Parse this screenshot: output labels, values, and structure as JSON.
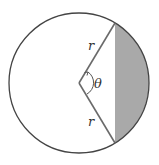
{
  "diagram": {
    "labels": {
      "radius_upper": "r",
      "radius_lower": "r",
      "angle": "θ"
    },
    "colors": {
      "outline": "#444444",
      "radius_lines": "#6a6a6a",
      "segment_fill": "#a9a9a9",
      "background": "#ffffff"
    }
  }
}
